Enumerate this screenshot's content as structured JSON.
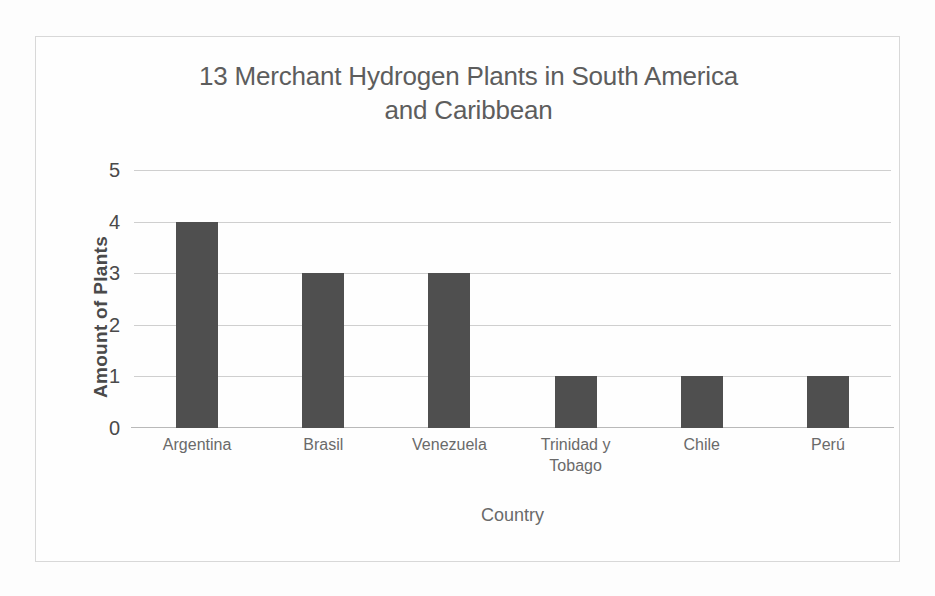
{
  "chart_data": {
    "type": "bar",
    "title": "13 Merchant Hydrogen Plants in South America and Caribbean",
    "title_lines": [
      "13 Merchant Hydrogen Plants in South America",
      "and Caribbean"
    ],
    "categories": [
      "Argentina",
      "Brasil",
      "Venezuela",
      "Trinidad y Tobago",
      "Chile",
      "Perú"
    ],
    "values": [
      4,
      3,
      3,
      1,
      1,
      1
    ],
    "xlabel": "Country",
    "ylabel": "Amount of  Plants",
    "ylim": [
      0,
      5
    ],
    "ytick_labels": [
      "5",
      "4",
      "3",
      "2",
      "1",
      "0"
    ],
    "ytick_values": [
      5,
      4,
      3,
      2,
      1,
      0
    ],
    "grid": "horizontal",
    "legend": "none",
    "bar_color": "#4f4f4f",
    "gridline_color": "#cfcfcf",
    "title_color": "#5d5d5d",
    "label_color": "#6a6a6a",
    "tick_color": "#4a4a4a"
  }
}
